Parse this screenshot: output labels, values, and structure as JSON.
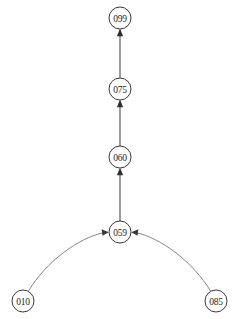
{
  "diagram": {
    "type": "directed-graph",
    "background_color": "#ffffff",
    "node_fill": "#ffffff",
    "node_stroke": "#3a3a3a",
    "edge_color": "#4a4a4a",
    "curve_edge_color": "#7a7a7a",
    "label_color": "#1c1c1c",
    "nodes": [
      {
        "id": "099",
        "label": "099",
        "cx": 120,
        "cy": 18,
        "r": 11
      },
      {
        "id": "075",
        "label": "075",
        "cx": 120,
        "cy": 89,
        "r": 11
      },
      {
        "id": "060",
        "label": "060",
        "cx": 120,
        "cy": 157,
        "r": 11
      },
      {
        "id": "059",
        "label": "059",
        "cx": 120,
        "cy": 232,
        "r": 11
      },
      {
        "id": "010",
        "label": "010",
        "cx": 23,
        "cy": 301,
        "r": 11
      },
      {
        "id": "085",
        "label": "085",
        "cx": 216,
        "cy": 301,
        "r": 11
      }
    ],
    "edges": [
      {
        "from": "075",
        "to": "099",
        "shape": "straight",
        "direction": "up"
      },
      {
        "from": "060",
        "to": "075",
        "shape": "straight",
        "direction": "up"
      },
      {
        "from": "059",
        "to": "060",
        "shape": "straight",
        "direction": "up"
      },
      {
        "from": "010",
        "to": "059",
        "shape": "curved",
        "direction": "right"
      },
      {
        "from": "085",
        "to": "059",
        "shape": "curved",
        "direction": "left"
      }
    ]
  }
}
